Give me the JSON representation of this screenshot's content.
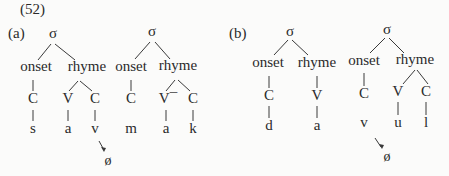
{
  "example_number": "(52)",
  "panels": [
    {
      "label": "(a)",
      "trees": [
        {
          "root": "σ",
          "onset": "onset",
          "rhyme": "rhyme",
          "onset_slots": [
            "C"
          ],
          "rhyme_slots": [
            "V",
            "C"
          ],
          "segments": [
            "s",
            "a",
            "v"
          ],
          "deletion": {
            "target": "v",
            "result": "ø"
          }
        },
        {
          "root": "σ",
          "onset": "onset",
          "rhyme": "rhyme",
          "onset_slots": [
            "C"
          ],
          "rhyme_slots": [
            "V¯",
            "C"
          ],
          "segments": [
            "m",
            "a",
            "k"
          ]
        }
      ]
    },
    {
      "label": "(b)",
      "trees": [
        {
          "root": "σ",
          "onset": "onset",
          "rhyme": "rhyme",
          "onset_slots": [
            "C"
          ],
          "rhyme_slots": [
            "V"
          ],
          "segments": [
            "d",
            "a"
          ]
        },
        {
          "root": "σ",
          "onset": "onset",
          "rhyme": "rhyme",
          "onset_slots": [
            "C"
          ],
          "rhyme_slots": [
            "V",
            "C"
          ],
          "segments": [
            "v",
            "u",
            "l"
          ],
          "deletion": {
            "target": "v",
            "result": "ø"
          }
        }
      ]
    }
  ]
}
